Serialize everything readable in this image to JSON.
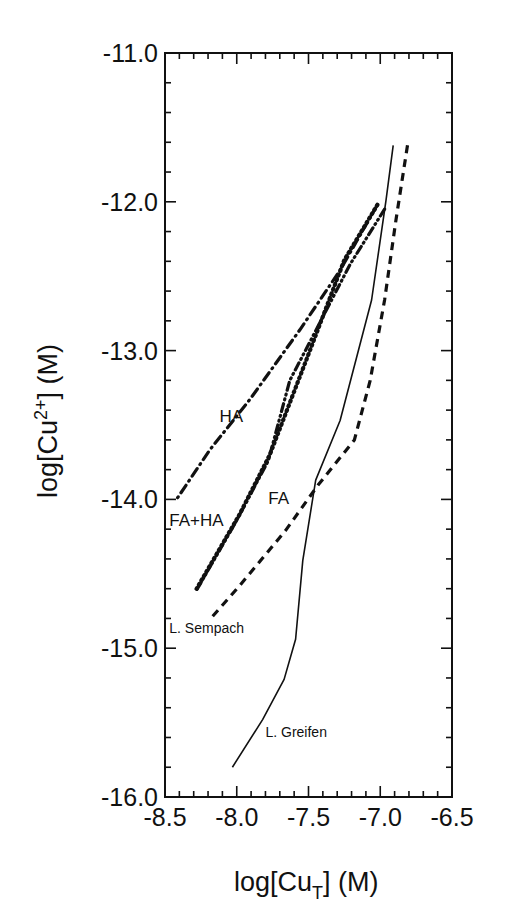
{
  "chart_data": {
    "type": "line",
    "title": "",
    "xlabel": "log[Cu_T] (M)",
    "ylabel": "log[Cu2+] (M)",
    "xlim": [
      -8.5,
      -6.5
    ],
    "ylim": [
      -16.0,
      -11.0
    ],
    "x_ticks": [
      "-8.5",
      "-8.0",
      "-7.5",
      "-7.0",
      "-6.5"
    ],
    "y_ticks": [
      "-11.0",
      "-12.0",
      "-13.0",
      "-14.0",
      "-15.0",
      "-16.0"
    ],
    "grid": false,
    "legend": "none (inline annotations)",
    "series": [
      {
        "name": "L. Greifen",
        "style": "solid",
        "x": [
          -6.91,
          -6.96,
          -7.06,
          -7.28,
          -7.45,
          -7.54,
          -7.59,
          -7.67,
          -7.82,
          -8.03
        ],
        "y": [
          -11.62,
          -11.99,
          -12.66,
          -13.47,
          -13.87,
          -14.41,
          -14.94,
          -15.21,
          -15.48,
          -15.8
        ]
      },
      {
        "name": "L. Sempach",
        "style": "dashed",
        "x": [
          -6.81,
          -6.89,
          -6.97,
          -7.07,
          -7.18,
          -7.43,
          -7.66,
          -7.98,
          -8.19
        ],
        "y": [
          -11.62,
          -12.12,
          -12.66,
          -13.2,
          -13.6,
          -13.9,
          -14.21,
          -14.58,
          -14.81
        ]
      },
      {
        "name": "FA",
        "style": "dotted",
        "x": [
          -7.02,
          -7.25,
          -7.49,
          -7.77,
          -7.98,
          -8.28
        ],
        "y": [
          -12.02,
          -12.39,
          -13.0,
          -13.7,
          -14.1,
          -14.6
        ]
      },
      {
        "name": "HA",
        "style": "dash-dot",
        "x": [
          -7.02,
          -7.28,
          -7.56,
          -7.91,
          -8.19,
          -8.42
        ],
        "y": [
          -12.02,
          -12.46,
          -12.86,
          -13.33,
          -13.67,
          -14.0
        ]
      },
      {
        "name": "FA+HA",
        "style": "dash-dot-dot",
        "x": [
          -6.97,
          -7.21,
          -7.5,
          -7.63,
          -7.78,
          -8.0,
          -8.28
        ],
        "y": [
          -12.05,
          -12.42,
          -12.96,
          -13.2,
          -13.74,
          -14.14,
          -14.61
        ]
      }
    ],
    "annotations": [
      {
        "text": "HA",
        "x": -8.12,
        "y": -13.48
      },
      {
        "text": "FA",
        "x": -7.78,
        "y": -14.03
      },
      {
        "text": "FA+HA",
        "x": -8.47,
        "y": -14.18
      },
      {
        "text": "L. Sempach",
        "x": -8.47,
        "y": -14.9
      },
      {
        "text": "L. Greifen",
        "x": -7.8,
        "y": -15.6
      }
    ]
  },
  "axes": {
    "x_title_main": "log[Cu",
    "x_title_sub": "T",
    "x_title_end": "] (M)",
    "y_title_main": "log[Cu",
    "y_title_sup": "2+",
    "y_title_end": "] (M)"
  }
}
